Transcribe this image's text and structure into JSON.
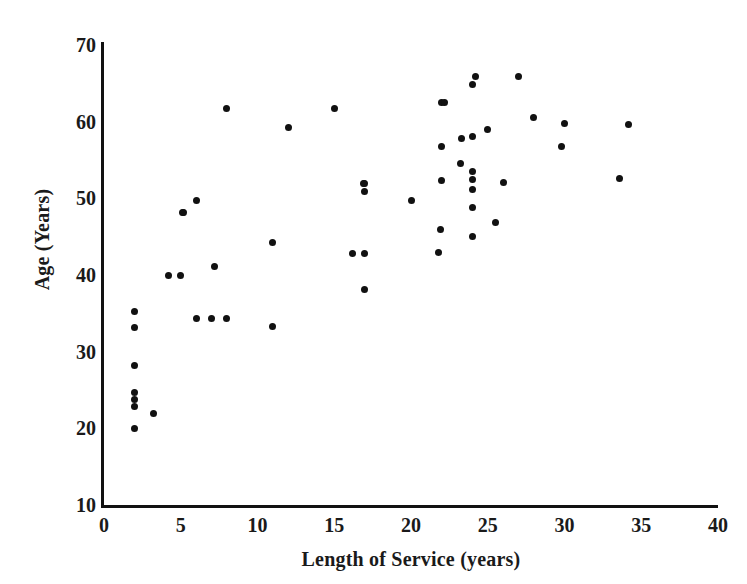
{
  "chart_data": {
    "type": "scatter",
    "title": "",
    "xlabel": "Length of Service (years)",
    "ylabel": "Age (Years)",
    "xlim": [
      0,
      40
    ],
    "ylim": [
      10,
      70
    ],
    "xticks": [
      0,
      5,
      10,
      15,
      20,
      25,
      30,
      35,
      40
    ],
    "xtick_labels": [
      "0",
      "5",
      "10",
      "15",
      "20",
      "25",
      "30",
      "35",
      "40"
    ],
    "yticks": [
      10,
      20,
      30,
      40,
      50,
      60,
      70
    ],
    "ytick_labels": [
      "10",
      "20",
      "30",
      "40",
      "50",
      "60",
      "70"
    ],
    "grid": false,
    "legend": null,
    "marker": "filled-circle",
    "marker_color": "#111111",
    "n_points": 54,
    "points": [
      {
        "x": 2.0,
        "y": 20.0
      },
      {
        "x": 2.0,
        "y": 22.8
      },
      {
        "x": 2.0,
        "y": 23.8
      },
      {
        "x": 2.0,
        "y": 24.7
      },
      {
        "x": 2.0,
        "y": 28.2
      },
      {
        "x": 2.0,
        "y": 33.2
      },
      {
        "x": 2.0,
        "y": 35.2
      },
      {
        "x": 3.2,
        "y": 21.9
      },
      {
        "x": 4.2,
        "y": 40.0
      },
      {
        "x": 5.0,
        "y": 40.0
      },
      {
        "x": 5.2,
        "y": 48.2
      },
      {
        "x": 6.0,
        "y": 34.3
      },
      {
        "x": 6.0,
        "y": 49.7
      },
      {
        "x": 7.0,
        "y": 34.3
      },
      {
        "x": 7.2,
        "y": 41.1
      },
      {
        "x": 8.0,
        "y": 34.3
      },
      {
        "x": 8.0,
        "y": 61.7
      },
      {
        "x": 11.0,
        "y": 33.3
      },
      {
        "x": 11.0,
        "y": 44.2
      },
      {
        "x": 12.0,
        "y": 59.3
      },
      {
        "x": 15.0,
        "y": 61.7
      },
      {
        "x": 16.2,
        "y": 42.8
      },
      {
        "x": 17.0,
        "y": 38.1
      },
      {
        "x": 17.0,
        "y": 42.8
      },
      {
        "x": 17.0,
        "y": 50.9
      },
      {
        "x": 17.0,
        "y": 51.9
      },
      {
        "x": 20.0,
        "y": 49.7
      },
      {
        "x": 21.8,
        "y": 42.9
      },
      {
        "x": 21.9,
        "y": 46.0
      },
      {
        "x": 22.0,
        "y": 52.3
      },
      {
        "x": 22.0,
        "y": 56.7
      },
      {
        "x": 22.0,
        "y": 62.5
      },
      {
        "x": 23.2,
        "y": 54.6
      },
      {
        "x": 23.3,
        "y": 57.8
      },
      {
        "x": 24.0,
        "y": 45.0
      },
      {
        "x": 24.0,
        "y": 48.8
      },
      {
        "x": 24.0,
        "y": 51.2
      },
      {
        "x": 24.0,
        "y": 52.4
      },
      {
        "x": 24.0,
        "y": 53.5
      },
      {
        "x": 24.0,
        "y": 58.1
      },
      {
        "x": 24.0,
        "y": 64.8
      },
      {
        "x": 24.2,
        "y": 65.9
      },
      {
        "x": 25.0,
        "y": 59.0
      },
      {
        "x": 25.5,
        "y": 46.9
      },
      {
        "x": 26.0,
        "y": 52.1
      },
      {
        "x": 27.0,
        "y": 65.9
      },
      {
        "x": 28.0,
        "y": 60.6
      },
      {
        "x": 29.8,
        "y": 56.8
      },
      {
        "x": 30.0,
        "y": 59.7
      },
      {
        "x": 33.6,
        "y": 52.6
      },
      {
        "x": 34.2,
        "y": 59.6
      },
      {
        "x": 22.2,
        "y": 62.5
      },
      {
        "x": 16.9,
        "y": 51.9
      },
      {
        "x": 5.1,
        "y": 48.2
      }
    ]
  },
  "axes": {
    "y_axis_name": "y-axis",
    "x_axis_name": "x-axis"
  }
}
